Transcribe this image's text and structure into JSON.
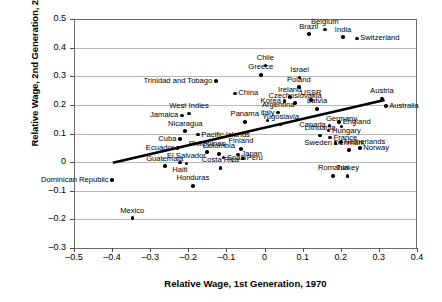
{
  "chart_data": {
    "type": "scatter",
    "title": "",
    "xlabel": "Relative Wage, 1st Generation, 1970",
    "ylabel": "Relative Wage, 2nd Generation, 2000",
    "xlim": [
      -0.5,
      0.4
    ],
    "ylim": [
      -0.3,
      0.5
    ],
    "xticks": [
      "-0.5",
      "-0.4",
      "-0.3",
      "-0.2",
      "-0.1",
      "0",
      "0.1",
      "0.2",
      "0.3",
      "0.4"
    ],
    "yticks": [
      "0.5",
      "0.4",
      "0.3",
      "0.2",
      "0.1",
      "0",
      "-0.1",
      "-0.2",
      "-0.3"
    ],
    "grid": "horizontal",
    "legend": "none",
    "trendline": {
      "x0": -0.398,
      "y0": -0.002,
      "x1": 0.315,
      "y1": 0.217
    },
    "points": [
      {
        "label": "Mexico",
        "x": -0.347,
        "y": -0.196,
        "pos": "above"
      },
      {
        "label": "Dominican Republic",
        "x": -0.4,
        "y": -0.063,
        "pos": "left"
      },
      {
        "label": "Guatemala",
        "x": -0.262,
        "y": -0.014,
        "pos": "above"
      },
      {
        "label": "Haiti",
        "x": -0.222,
        "y": -0.002,
        "pos": "below"
      },
      {
        "label": "Ecuador",
        "x": -0.228,
        "y": 0.05,
        "pos": "left"
      },
      {
        "label": "Cuba",
        "x": -0.222,
        "y": 0.08,
        "pos": "left"
      },
      {
        "label": "El Salvador",
        "x": -0.205,
        "y": -0.005,
        "pos": "above"
      },
      {
        "label": "Honduras",
        "x": -0.188,
        "y": -0.083,
        "pos": "above"
      },
      {
        "label": "Jamaica",
        "x": -0.217,
        "y": 0.163,
        "pos": "left"
      },
      {
        "label": "Nicaragua",
        "x": -0.208,
        "y": 0.108,
        "pos": "above"
      },
      {
        "label": "West Indies",
        "x": -0.198,
        "y": 0.17,
        "pos": "above"
      },
      {
        "label": "Pacific Islands",
        "x": -0.175,
        "y": 0.096,
        "pos": "right"
      },
      {
        "label": "Philippines",
        "x": -0.151,
        "y": 0.036,
        "pos": "above"
      },
      {
        "label": "Colombia",
        "x": -0.12,
        "y": 0.029,
        "pos": "above"
      },
      {
        "label": "Spain",
        "x": -0.108,
        "y": 0.016,
        "pos": "right"
      },
      {
        "label": "Costa Rica",
        "x": -0.116,
        "y": -0.02,
        "pos": "above"
      },
      {
        "label": "Trinidad and Tobago",
        "x": -0.128,
        "y": 0.283,
        "pos": "left"
      },
      {
        "label": "China",
        "x": -0.078,
        "y": 0.24,
        "pos": "right"
      },
      {
        "label": "Panama",
        "x": -0.052,
        "y": 0.141,
        "pos": "above"
      },
      {
        "label": "Peru",
        "x": -0.056,
        "y": 0.013,
        "pos": "right"
      },
      {
        "label": "Japan",
        "x": -0.07,
        "y": 0.027,
        "pos": "right"
      },
      {
        "label": "Finland",
        "x": -0.062,
        "y": 0.046,
        "pos": "above"
      },
      {
        "label": "Chile",
        "x": 0.002,
        "y": 0.337,
        "pos": "above"
      },
      {
        "label": "Greece",
        "x": -0.01,
        "y": 0.305,
        "pos": "above"
      },
      {
        "label": "Italy",
        "x": 0.008,
        "y": 0.145,
        "pos": "above"
      },
      {
        "label": "Yugoslavia",
        "x": 0.042,
        "y": 0.132,
        "pos": "above"
      },
      {
        "label": "Argentina",
        "x": 0.036,
        "y": 0.174,
        "pos": "above"
      },
      {
        "label": "Korea",
        "x": 0.052,
        "y": 0.214,
        "pos": "left"
      },
      {
        "label": "Ireland",
        "x": 0.066,
        "y": 0.227,
        "pos": "above"
      },
      {
        "label": "Czechoslovakia",
        "x": 0.08,
        "y": 0.206,
        "pos": "above"
      },
      {
        "label": "Poland",
        "x": 0.09,
        "y": 0.262,
        "pos": "above"
      },
      {
        "label": "Israel",
        "x": 0.092,
        "y": 0.296,
        "pos": "above"
      },
      {
        "label": "USSR",
        "x": 0.122,
        "y": 0.216,
        "pos": "above"
      },
      {
        "label": "Latvia",
        "x": 0.138,
        "y": 0.186,
        "pos": "above"
      },
      {
        "label": "Brazil",
        "x": 0.116,
        "y": 0.447,
        "pos": "above"
      },
      {
        "label": "Belgium",
        "x": 0.158,
        "y": 0.464,
        "pos": "above"
      },
      {
        "label": "India",
        "x": 0.206,
        "y": 0.437,
        "pos": "above"
      },
      {
        "label": "Switzerland",
        "x": 0.242,
        "y": 0.432,
        "pos": "right"
      },
      {
        "label": "Canada",
        "x": 0.17,
        "y": 0.128,
        "pos": "left"
      },
      {
        "label": "Hungary",
        "x": 0.168,
        "y": 0.11,
        "pos": "right"
      },
      {
        "label": "Lithuania",
        "x": 0.146,
        "y": 0.093,
        "pos": "above"
      },
      {
        "label": "France",
        "x": 0.172,
        "y": 0.086,
        "pos": "right"
      },
      {
        "label": "Germany",
        "x": 0.202,
        "y": 0.125,
        "pos": "above"
      },
      {
        "label": "England",
        "x": 0.196,
        "y": 0.141,
        "pos": "right"
      },
      {
        "label": "Sweden",
        "x": 0.186,
        "y": 0.066,
        "pos": "left"
      },
      {
        "label": "Netherlands",
        "x": 0.2,
        "y": 0.07,
        "pos": "right"
      },
      {
        "label": "Denmark",
        "x": 0.222,
        "y": 0.042,
        "pos": "above"
      },
      {
        "label": "Norway",
        "x": 0.25,
        "y": 0.05,
        "pos": "right"
      },
      {
        "label": "Romania",
        "x": 0.18,
        "y": -0.048,
        "pos": "above"
      },
      {
        "label": "Turkey",
        "x": 0.218,
        "y": -0.048,
        "pos": "above"
      },
      {
        "label": "Austria",
        "x": 0.308,
        "y": 0.222,
        "pos": "above"
      },
      {
        "label": "Australia",
        "x": 0.318,
        "y": 0.196,
        "pos": "right"
      }
    ]
  }
}
